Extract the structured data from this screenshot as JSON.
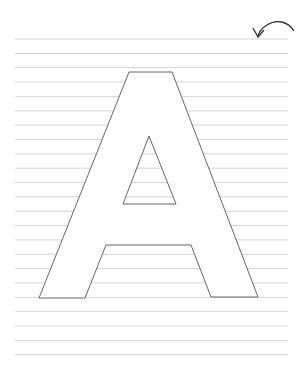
{
  "worksheet": {
    "letter": "A",
    "line_color": "#d4d4d4",
    "outline_color": "#555555",
    "lines": {
      "x_start": 15,
      "x_end": 288,
      "y_first": 39,
      "spacing": 14.35,
      "count": 23
    },
    "letter_outline": [
      [
        129,
        72
      ],
      [
        172,
        72
      ],
      [
        258,
        297
      ],
      [
        211,
        297
      ],
      [
        191,
        245
      ],
      [
        106,
        245
      ],
      [
        85,
        298
      ],
      [
        39,
        298
      ]
    ],
    "letter_hole": [
      [
        149,
        136
      ],
      [
        176,
        204
      ],
      [
        123,
        204
      ]
    ],
    "icon": "curved-arrow-back-icon"
  }
}
